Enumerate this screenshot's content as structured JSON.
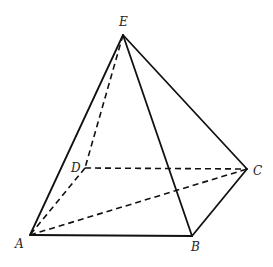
{
  "diagram": {
    "type": "square pyramid",
    "vertices": {
      "A": {
        "label": "A"
      },
      "B": {
        "label": "B"
      },
      "C": {
        "label": "C"
      },
      "D": {
        "label": "D"
      },
      "E": {
        "label": "E"
      }
    },
    "solid_edges": [
      [
        "E",
        "A"
      ],
      [
        "E",
        "B"
      ],
      [
        "E",
        "C"
      ],
      [
        "A",
        "B"
      ],
      [
        "B",
        "C"
      ]
    ],
    "hidden_edges": [
      [
        "E",
        "D"
      ],
      [
        "D",
        "A"
      ],
      [
        "D",
        "C"
      ],
      [
        "A",
        "C"
      ]
    ]
  }
}
